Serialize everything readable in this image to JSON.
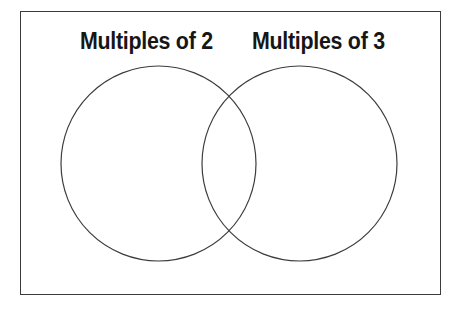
{
  "page": {
    "background_color": "#ffffff",
    "width": 461,
    "height": 309
  },
  "frame": {
    "stroke_color": "#3c3c3c",
    "stroke_width": 1.6,
    "x": 20,
    "y": 11,
    "width": 421,
    "height": 284
  },
  "venn": {
    "stroke_color": "#3c3c3c",
    "stroke_width": 1.2,
    "fill": "none",
    "circles": [
      {
        "id": "left",
        "label": "Multiples of 2",
        "cx": 158.5,
        "cy": 163.5,
        "r": 97.5
      },
      {
        "id": "right",
        "label": "Multiples of 3",
        "cx": 299.5,
        "cy": 163.5,
        "r": 97.5
      }
    ],
    "intersection_points": [
      {
        "x": 229,
        "y": 77
      },
      {
        "x": 229,
        "y": 251
      }
    ],
    "regions": {
      "left_only": "",
      "overlap": "",
      "right_only": ""
    }
  },
  "labels": {
    "left": "Multiples of 2",
    "right": "Multiples of 3",
    "color": "#161616",
    "font_size": 23
  }
}
